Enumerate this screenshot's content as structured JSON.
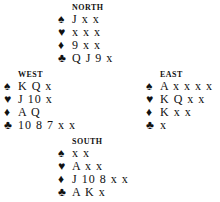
{
  "hands": {
    "north": {
      "label": "NORTH",
      "spades": "J x x",
      "hearts": "x x x",
      "diamonds": "9 x x",
      "clubs": "Q J 9 x"
    },
    "west": {
      "label": "WEST",
      "spades": "K Q x",
      "hearts": "J 10 x",
      "diamonds": "A Q",
      "clubs": "10 8 7 x x"
    },
    "east": {
      "label": "EAST",
      "spades": "A x x x x",
      "hearts": "K Q x x",
      "diamonds": "K x x",
      "clubs": "x"
    },
    "south": {
      "label": "SOUTH",
      "spades": "x x",
      "hearts": "A x x",
      "diamonds": "J 10 8 x x",
      "clubs": "A K x"
    }
  },
  "suits": {
    "spades": "♠",
    "hearts": "♥",
    "diamonds": "♦",
    "clubs": "♣"
  }
}
